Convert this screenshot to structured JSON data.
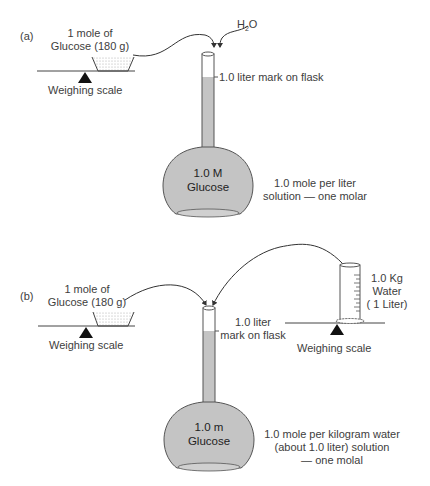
{
  "panel_a": {
    "label": "(a)",
    "glucose_line1": "1 mole of",
    "glucose_line2": "Glucose (180 g)",
    "scale_label": "Weighing scale",
    "water_label": "H2O",
    "mark_label": "1.0 liter mark on flask",
    "flask_line1": "1.0 M",
    "flask_line2": "Glucose",
    "desc_line1": "1.0 mole per liter",
    "desc_line2": "solution — one molar"
  },
  "panel_b": {
    "label": "(b)",
    "glucose_line1": "1 mole of",
    "glucose_line2": "Glucose (180 g)",
    "scale_left_label": "Weighing scale",
    "scale_right_label": "Weighing scale",
    "mark_line1": "1.0 liter",
    "mark_line2": "mark on flask",
    "water_line1": "1.0 Kg",
    "water_line2": "Water",
    "water_line3": "( 1 Liter)",
    "flask_line1": "1.0 m",
    "flask_line2": "Glucose",
    "desc_line1": "1.0 mole per kilogram water",
    "desc_line2": "(about 1.0 liter) solution",
    "desc_line3": "— one molal"
  },
  "colors": {
    "liquid": "#c4c4c4",
    "outline": "#555555",
    "text": "#3d3d3d"
  }
}
